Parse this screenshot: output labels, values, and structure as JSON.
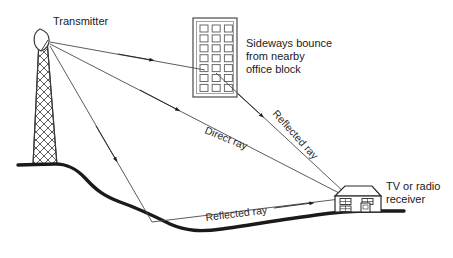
{
  "figure": {
    "type": "technical-line-diagram",
    "background_color": "#ffffff",
    "line_color": "#3a3a3a",
    "ground_color": "#1a1a1a",
    "text_color": "#1a1a1a"
  },
  "labels": {
    "transmitter": "Transmitter",
    "office_block_line1": "Sideways bounce",
    "office_block_line2": "from nearby",
    "office_block_line3": "office block",
    "direct_ray": "Direct ray",
    "reflected_ray_building": "Reflected ray",
    "reflected_ray_ground": "Reflected ray",
    "receiver_line1": "TV or radio",
    "receiver_line2": "receiver"
  },
  "objects": {
    "transmitter_tower": {
      "name": "lattice mast with dish antenna",
      "mast_pattern": "cross-hatch lattice",
      "antenna_type": "dish",
      "antenna_direction": "right"
    },
    "office_block": {
      "name": "office block",
      "window_columns": 3,
      "window_rows": 7,
      "window_count": 21
    },
    "house": {
      "name": "house with TV or radio receiver",
      "roof_type": "hipped",
      "window_rows": 2,
      "window_columns": 2,
      "window_count": 4,
      "door_count": 1
    },
    "terrain": {
      "name": "hillside and valley ground profile",
      "style": "thick black undulating line"
    }
  },
  "rays": [
    {
      "id": "ray-to-office-block",
      "label": "",
      "from": "transmitter",
      "to": "office block",
      "has_arrowhead": true
    },
    {
      "id": "ray-reflected-building",
      "label": "Reflected ray",
      "from": "office block",
      "to": "receiver",
      "has_arrowhead": true
    },
    {
      "id": "ray-direct",
      "label": "Direct ray",
      "from": "transmitter",
      "to": "receiver",
      "has_arrowhead": true
    },
    {
      "id": "ray-to-ground",
      "label": "",
      "from": "transmitter",
      "to": "valley floor",
      "has_arrowhead": true
    },
    {
      "id": "ray-reflected-ground",
      "label": "Reflected ray",
      "from": "valley floor",
      "to": "receiver",
      "has_arrowhead": true
    }
  ]
}
